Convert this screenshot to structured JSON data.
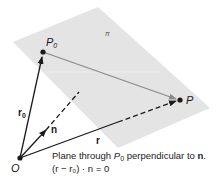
{
  "diagram": {
    "plane_label": "π",
    "points": {
      "origin": "O",
      "p0": "P",
      "p0_sub": "0",
      "p": "P"
    },
    "vectors": {
      "r0": "r",
      "r0_sub": "0",
      "r": "r",
      "n": "n"
    },
    "caption": {
      "line1_pre": "Plane through ",
      "line1_point": "P",
      "line1_sub": "0",
      "line1_mid": " perpendicular to ",
      "line1_vec": "n",
      "line1_end": ".",
      "line2": "(r − r₀) · n = 0"
    },
    "colors": {
      "plane": "#e4e4e4",
      "vector": "#1a1a1a",
      "p0_to_p": "#8a8a8a",
      "background": "#ffffff"
    }
  }
}
